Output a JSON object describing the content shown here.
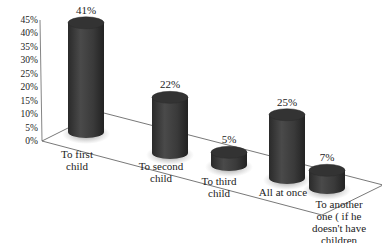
{
  "chart_data": {
    "type": "bar",
    "style": "3d-cylinder",
    "title": "",
    "xlabel": "",
    "ylabel": "",
    "categories": [
      [
        "To first",
        "child"
      ],
      [
        "To second",
        "child"
      ],
      [
        "To third",
        "child"
      ],
      [
        "All at once"
      ],
      [
        "To another",
        "one ( if he",
        "doesn't have",
        "children"
      ]
    ],
    "values": [
      41,
      22,
      5,
      25,
      7
    ],
    "value_labels": [
      "41%",
      "22%",
      "5%",
      "25%",
      "7%"
    ],
    "yticks": [
      "0%",
      "5%",
      "10%",
      "15%",
      "20%",
      "25%",
      "30%",
      "35%",
      "40%",
      "45%"
    ],
    "ylim": [
      0,
      45
    ],
    "grid": false,
    "legend": null,
    "bar_color": "#3a3a3a"
  }
}
